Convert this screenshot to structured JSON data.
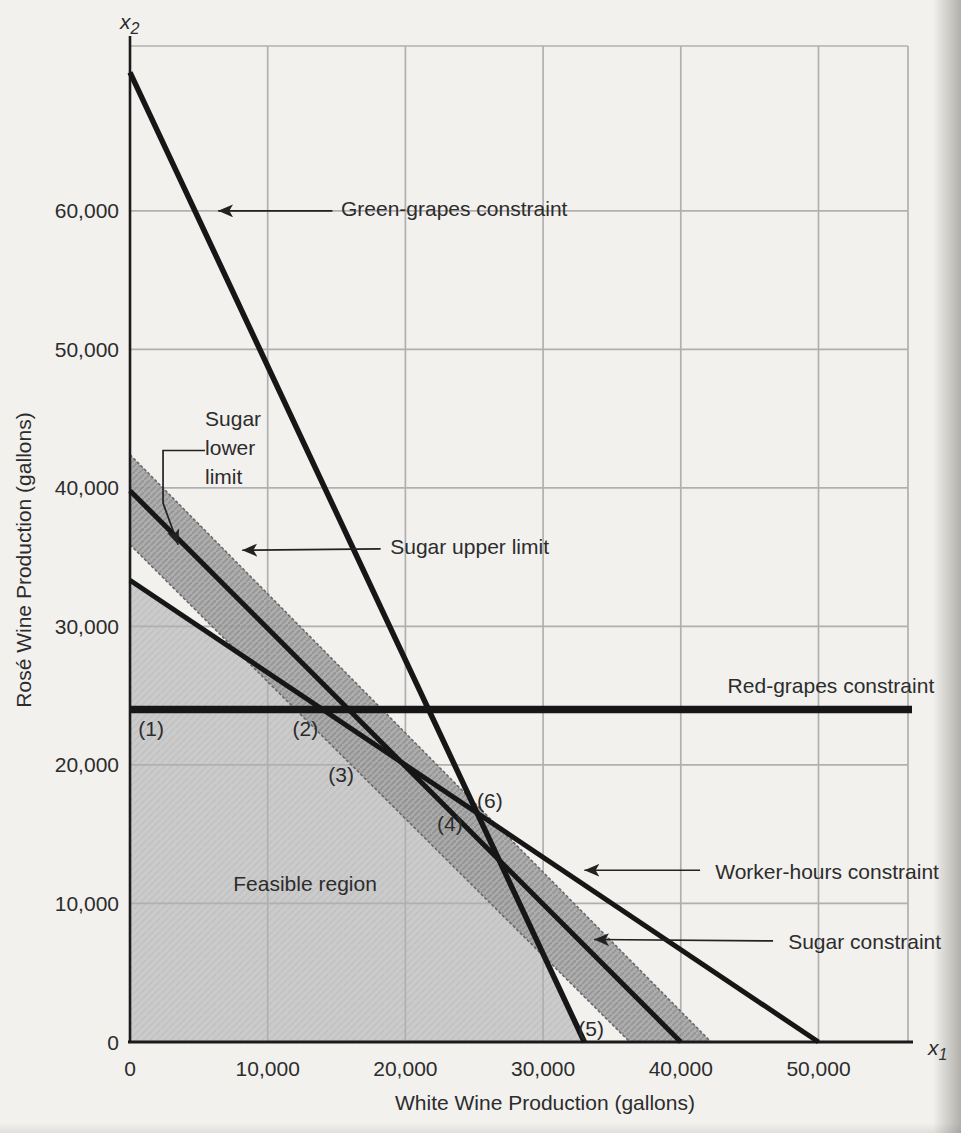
{
  "page": {
    "background": "#f2f1ee"
  },
  "chart_data": {
    "type": "line",
    "subtype": "lp-constraint-diagram",
    "title": "",
    "xlabel": "White Wine Production (gallons)",
    "ylabel": "Rosé Wine Production (gallons)",
    "x_axis_symbol": {
      "base": "x",
      "sub": "1"
    },
    "y_axis_symbol": {
      "base": "x",
      "sub": "2"
    },
    "xlim": [
      0,
      56500
    ],
    "ylim": [
      0,
      71900
    ],
    "x_ticks": [
      0,
      10000,
      20000,
      30000,
      40000,
      50000
    ],
    "y_ticks": [
      0,
      10000,
      20000,
      30000,
      40000,
      50000,
      60000
    ],
    "grid": true,
    "constraint_lines": [
      {
        "id": "green_grapes",
        "label": "Green-grapes constraint",
        "x1_intercept": 33000,
        "x2_intercept": 70000,
        "width": 5.5
      },
      {
        "id": "worker_hours",
        "label": "Worker-hours constraint",
        "x1_intercept": 50000,
        "x2_intercept": 33333,
        "width": 5
      },
      {
        "id": "sugar",
        "label": "Sugar constraint",
        "x1_intercept": 40000,
        "x2_intercept": 39800,
        "width": 5
      },
      {
        "id": "red_grapes",
        "label": "Red-grapes constraint",
        "horizontal_at_x2": 24000,
        "width": 7.5
      }
    ],
    "sugar_band": {
      "label_upper": "Sugar upper limit",
      "label_lower": "Sugar lower limit",
      "upper": {
        "x1_intercept": 42200,
        "x2_intercept": 42400
      },
      "lower": {
        "x1_intercept": 36300,
        "x2_intercept": 35900
      }
    },
    "feasible_region": {
      "label": "Feasible region",
      "label_at": [
        7500,
        10900
      ],
      "bounded_by": [
        "x1-axis",
        "x2-axis",
        "worker_hours",
        "green_grapes"
      ]
    },
    "corner_points": [
      {
        "text": "(1)",
        "at": [
          600,
          22100
        ]
      },
      {
        "text": "(2)",
        "at": [
          11800,
          22100
        ]
      },
      {
        "text": "(3)",
        "at": [
          14400,
          18800
        ]
      },
      {
        "text": "(4)",
        "at": [
          22300,
          15200
        ]
      },
      {
        "text": "(5)",
        "at": [
          32550,
          400
        ]
      },
      {
        "text": "(6)",
        "at": [
          25200,
          16900
        ]
      }
    ],
    "annotations": [
      {
        "id": "green-grapes-label",
        "text": "Green-grapes constraint",
        "text_at": [
          15320,
          59600
        ],
        "arrow": [
          [
            14700,
            60000
          ],
          [
            6400,
            60000
          ]
        ]
      },
      {
        "id": "sugar-lower-label",
        "lines": [
          "Sugar",
          "lower",
          "limit"
        ],
        "text_at": [
          5450,
          44500
        ],
        "arrow": [
          [
            5450,
            42700
          ],
          [
            2400,
            42700
          ],
          [
            2400,
            38900
          ],
          [
            3500,
            35900
          ]
        ]
      },
      {
        "id": "sugar-upper-label",
        "text": "Sugar upper limit",
        "text_at": [
          18900,
          35200
        ],
        "arrow": [
          [
            18200,
            35600
          ],
          [
            8150,
            35500
          ]
        ]
      },
      {
        "id": "red-grapes-label",
        "text": "Red-grapes constraint",
        "text_at": [
          43400,
          25200
        ],
        "arrow": null
      },
      {
        "id": "worker-hours-label",
        "text": "Worker-hours constraint",
        "text_at": [
          42500,
          11800
        ],
        "arrow": [
          [
            41400,
            12400
          ],
          [
            33000,
            12400
          ]
        ]
      },
      {
        "id": "sugar-constraint-label",
        "text": "Sugar constraint",
        "text_at": [
          47800,
          6700
        ],
        "arrow": [
          [
            46700,
            7300
          ],
          [
            33700,
            7400
          ]
        ]
      }
    ],
    "colors": {
      "line": "#161616",
      "axis": "#1b1b1b",
      "grid": "#b0b0b0",
      "text": "#2c2c2c",
      "feasible_fill": "#cbcbcb",
      "band_fill": "#a7a7a7",
      "band_hatch": "#8e8e8e",
      "band_edge": "#696969",
      "arrow": "#222222"
    }
  }
}
